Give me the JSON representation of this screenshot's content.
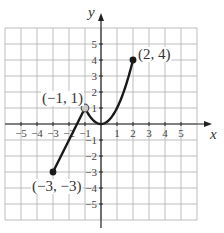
{
  "chart_data": {
    "type": "line",
    "title": "",
    "xlabel": "x",
    "ylabel": "y",
    "xlim": [
      -6,
      6
    ],
    "ylim": [
      -6,
      6
    ],
    "grid": true,
    "x_ticks": [
      -5,
      -4,
      -3,
      -2,
      -1,
      1,
      2,
      3,
      4,
      5
    ],
    "y_ticks": [
      -5,
      -4,
      -3,
      -2,
      -1,
      1,
      2,
      3,
      4,
      5
    ],
    "x_tick_labels": [
      "−5",
      "−4",
      "−3",
      "−2",
      "−1",
      "1",
      "2",
      "3",
      "4",
      "5"
    ],
    "y_tick_labels": [
      "−5",
      "−4",
      "−3",
      "−2",
      "−1",
      "1",
      "2",
      "3",
      "4",
      "5"
    ],
    "series": [
      {
        "name": "segment-line",
        "description": "line segment from (-3,-3) to (-1,1)",
        "x": [
          -3,
          -1
        ],
        "y": [
          -3,
          1
        ]
      },
      {
        "name": "parabola",
        "description": "y = x^2 on [-1, 2]",
        "x": [
          -1,
          -0.5,
          0,
          0.5,
          1,
          1.5,
          2
        ],
        "y": [
          1,
          0.25,
          0,
          0.25,
          1,
          2.25,
          4
        ]
      }
    ],
    "points": [
      {
        "x": 2,
        "y": 4,
        "label": "(2, 4)",
        "style": "filled"
      },
      {
        "x": -1,
        "y": 1,
        "label": "(−1, 1)",
        "style": "open"
      },
      {
        "x": -3,
        "y": -3,
        "label": "(−3, −3)",
        "style": "filled"
      }
    ],
    "colors": {
      "curve": "#1a1a1a",
      "grid": "#bdbdbd",
      "axis": "#222222",
      "open_point_fill": "#c8c8c8"
    }
  },
  "axes": {
    "x_label": "x",
    "y_label": "y"
  },
  "annotations": {
    "p1": "(2, 4)",
    "p2": "(−1, 1)",
    "p3": "(−3, −3)"
  }
}
